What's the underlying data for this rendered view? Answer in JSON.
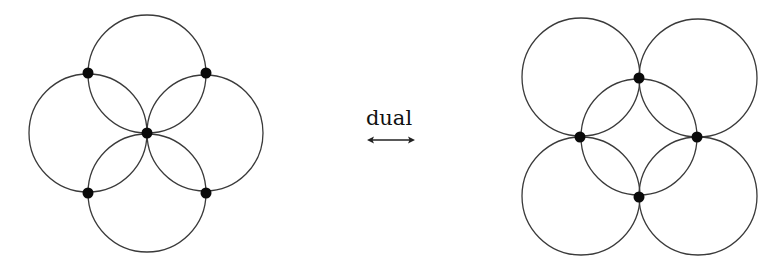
{
  "diagram": {
    "colors": {
      "stroke": "#3a3a3a",
      "vertex": "#0a0a0a",
      "background": "#ffffff"
    },
    "left_graph": {
      "vertices": [
        {
          "x": 88,
          "y": 73
        },
        {
          "x": 206,
          "y": 73
        },
        {
          "x": 147,
          "y": 133
        },
        {
          "x": 88,
          "y": 193
        },
        {
          "x": 206,
          "y": 193
        }
      ],
      "circles": [
        {
          "cx": 147,
          "cy": 74,
          "r": 59
        },
        {
          "cx": 88,
          "cy": 133,
          "r": 59
        },
        {
          "cx": 205,
          "cy": 133,
          "r": 58
        },
        {
          "cx": 147,
          "cy": 193,
          "r": 59
        }
      ]
    },
    "relation": {
      "label": "dual",
      "arrow": "double-headed-arrow"
    },
    "right_graph": {
      "vertices": [
        {
          "x": 639,
          "y": 78
        },
        {
          "x": 580,
          "y": 137
        },
        {
          "x": 697,
          "y": 137
        },
        {
          "x": 639,
          "y": 197
        }
      ],
      "circles": [
        {
          "cx": 581,
          "cy": 77,
          "r": 59
        },
        {
          "cx": 698,
          "cy": 78,
          "r": 59
        },
        {
          "cx": 639,
          "cy": 137,
          "r": 58
        },
        {
          "cx": 581,
          "cy": 196,
          "r": 59
        },
        {
          "cx": 698,
          "cy": 196,
          "r": 59
        }
      ]
    }
  }
}
